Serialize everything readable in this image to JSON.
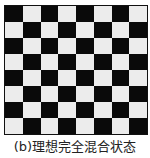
{
  "figure": {
    "caption": "(b)理想完全混合状态",
    "grid": {
      "rows": 8,
      "cols": 8,
      "top_left": "black"
    },
    "colors": {
      "black": "#0a0a0a",
      "white": "#ececec"
    }
  }
}
